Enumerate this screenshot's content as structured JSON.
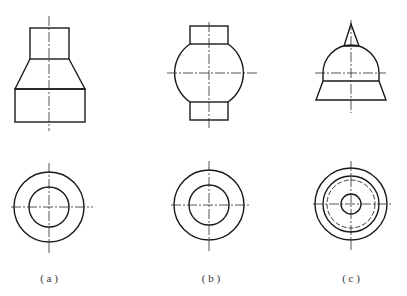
{
  "figure": {
    "colors": {
      "line": "#1a1a1a",
      "background": "#ffffff"
    },
    "panels": [
      {
        "id": "a",
        "label": "( a )",
        "front": "cylinder on frustum on cylinder",
        "top": "two concentric circles"
      },
      {
        "id": "b",
        "label": "( b )",
        "front": "sphere with cylinders top and bottom",
        "top": "two concentric circles"
      },
      {
        "id": "c",
        "label": "( c )",
        "front": "cone on hemisphere on frustum",
        "top": "concentric circles with hidden dashed circle"
      }
    ]
  }
}
